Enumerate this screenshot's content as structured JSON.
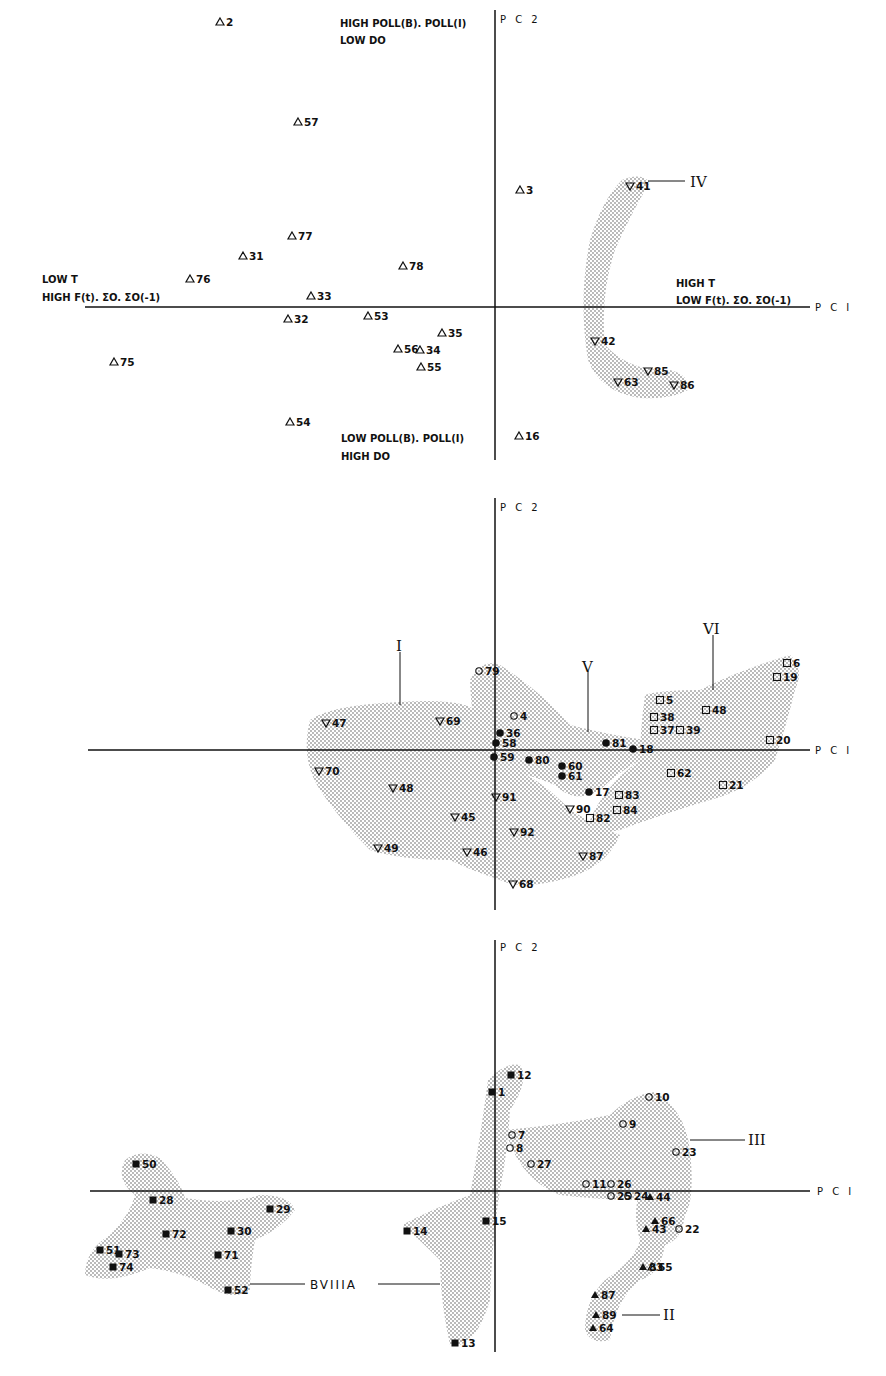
{
  "chart_data": [
    {
      "type": "scatter",
      "panel": "top",
      "xlabel": "PC I",
      "ylabel": "PC 2",
      "axis_annotations": {
        "top": [
          "HIGH POLL(B). POLL(I)",
          "LOW DO"
        ],
        "bottom": [
          "LOW POLL(B). POLL(I)",
          "HIGH DO"
        ],
        "left": [
          "LOW T",
          "HIGH F(t). ΣO. ΣO(-1)"
        ],
        "right": [
          "HIGH T",
          "LOW F(t). ΣO. ΣO(-1)"
        ]
      },
      "groups": [
        {
          "name": "IV",
          "marker": "down-triangle",
          "members": [
            "41",
            "42",
            "63",
            "85",
            "86"
          ]
        }
      ],
      "points": [
        {
          "id": "2",
          "marker": "triangle",
          "x": 220,
          "y": 22
        },
        {
          "id": "57",
          "marker": "triangle",
          "x": 298,
          "y": 122
        },
        {
          "id": "3",
          "marker": "triangle",
          "x": 520,
          "y": 190
        },
        {
          "id": "41",
          "marker": "down-triangle",
          "x": 630,
          "y": 186
        },
        {
          "id": "77",
          "marker": "triangle",
          "x": 292,
          "y": 236
        },
        {
          "id": "31",
          "marker": "triangle",
          "x": 243,
          "y": 256
        },
        {
          "id": "78",
          "marker": "triangle",
          "x": 403,
          "y": 266
        },
        {
          "id": "76",
          "marker": "triangle",
          "x": 190,
          "y": 279
        },
        {
          "id": "33",
          "marker": "triangle",
          "x": 311,
          "y": 296
        },
        {
          "id": "32",
          "marker": "triangle",
          "x": 288,
          "y": 319
        },
        {
          "id": "53",
          "marker": "triangle",
          "x": 368,
          "y": 316
        },
        {
          "id": "35",
          "marker": "triangle",
          "x": 442,
          "y": 333
        },
        {
          "id": "56",
          "marker": "triangle",
          "x": 398,
          "y": 349
        },
        {
          "id": "34",
          "marker": "triangle",
          "x": 420,
          "y": 350
        },
        {
          "id": "55",
          "marker": "triangle",
          "x": 421,
          "y": 367
        },
        {
          "id": "75",
          "marker": "triangle",
          "x": 114,
          "y": 362
        },
        {
          "id": "42",
          "marker": "down-triangle",
          "x": 595,
          "y": 341
        },
        {
          "id": "85",
          "marker": "down-triangle",
          "x": 648,
          "y": 371
        },
        {
          "id": "63",
          "marker": "down-triangle",
          "x": 618,
          "y": 382
        },
        {
          "id": "86",
          "marker": "down-triangle",
          "x": 674,
          "y": 385
        },
        {
          "id": "54",
          "marker": "triangle",
          "x": 290,
          "y": 422
        },
        {
          "id": "16",
          "marker": "triangle",
          "x": 519,
          "y": 436
        }
      ]
    },
    {
      "type": "scatter",
      "panel": "middle",
      "xlabel": "PC I",
      "ylabel": "PC 2",
      "groups": [
        {
          "name": "I",
          "marker": "down-triangle",
          "members": [
            "47",
            "69",
            "70",
            "48",
            "45",
            "49",
            "46",
            "91",
            "92",
            "90",
            "87",
            "68"
          ]
        },
        {
          "name": "V",
          "marker": "filled-circle",
          "members": [
            "79",
            "4",
            "36",
            "58",
            "59",
            "80",
            "60",
            "61",
            "81",
            "18",
            "17"
          ]
        },
        {
          "name": "VI",
          "marker": "square",
          "members": [
            "5",
            "38",
            "37",
            "39",
            "48",
            "6",
            "19",
            "20",
            "62",
            "21",
            "83",
            "84",
            "82"
          ]
        }
      ],
      "points": [
        {
          "id": "79",
          "marker": "circle",
          "x": 479,
          "y": 671
        },
        {
          "id": "4",
          "marker": "circle",
          "x": 514,
          "y": 716
        },
        {
          "id": "36",
          "marker": "filled-circle",
          "x": 500,
          "y": 733
        },
        {
          "id": "58",
          "marker": "filled-circle",
          "x": 496,
          "y": 743
        },
        {
          "id": "59",
          "marker": "filled-circle",
          "x": 494,
          "y": 757
        },
        {
          "id": "80",
          "marker": "filled-circle",
          "x": 529,
          "y": 760
        },
        {
          "id": "60",
          "marker": "filled-circle",
          "x": 562,
          "y": 766
        },
        {
          "id": "61",
          "marker": "filled-circle",
          "x": 562,
          "y": 776
        },
        {
          "id": "81",
          "marker": "filled-circle",
          "x": 606,
          "y": 743
        },
        {
          "id": "18",
          "marker": "filled-circle",
          "x": 633,
          "y": 749
        },
        {
          "id": "17",
          "marker": "filled-circle",
          "x": 589,
          "y": 792
        },
        {
          "id": "47",
          "marker": "down-triangle",
          "x": 326,
          "y": 723
        },
        {
          "id": "69",
          "marker": "down-triangle",
          "x": 440,
          "y": 721
        },
        {
          "id": "70",
          "marker": "down-triangle",
          "x": 319,
          "y": 771
        },
        {
          "id": "48",
          "marker": "down-triangle",
          "x": 393,
          "y": 788
        },
        {
          "id": "91",
          "marker": "down-triangle",
          "x": 496,
          "y": 797
        },
        {
          "id": "45",
          "marker": "down-triangle",
          "x": 455,
          "y": 817
        },
        {
          "id": "92",
          "marker": "down-triangle",
          "x": 514,
          "y": 832
        },
        {
          "id": "90",
          "marker": "down-triangle",
          "x": 570,
          "y": 809
        },
        {
          "id": "49",
          "marker": "down-triangle",
          "x": 378,
          "y": 848
        },
        {
          "id": "46",
          "marker": "down-triangle",
          "x": 467,
          "y": 852
        },
        {
          "id": "87",
          "marker": "down-triangle",
          "x": 583,
          "y": 856
        },
        {
          "id": "68",
          "marker": "down-triangle",
          "x": 513,
          "y": 884
        },
        {
          "id": "6",
          "marker": "square",
          "x": 787,
          "y": 663
        },
        {
          "id": "19",
          "marker": "square",
          "x": 777,
          "y": 677
        },
        {
          "id": "5",
          "marker": "square",
          "x": 660,
          "y": 700
        },
        {
          "id": "48",
          "marker": "square",
          "x": 706,
          "y": 710
        },
        {
          "id": "38",
          "marker": "square",
          "x": 654,
          "y": 717
        },
        {
          "id": "37",
          "marker": "square",
          "x": 654,
          "y": 730
        },
        {
          "id": "39",
          "marker": "square",
          "x": 680,
          "y": 730
        },
        {
          "id": "20",
          "marker": "square",
          "x": 770,
          "y": 740
        },
        {
          "id": "62",
          "marker": "square",
          "x": 671,
          "y": 773
        },
        {
          "id": "21",
          "marker": "square",
          "x": 723,
          "y": 785
        },
        {
          "id": "83",
          "marker": "square",
          "x": 619,
          "y": 795
        },
        {
          "id": "84",
          "marker": "square",
          "x": 617,
          "y": 810
        },
        {
          "id": "82",
          "marker": "square",
          "x": 590,
          "y": 818
        }
      ]
    },
    {
      "type": "scatter",
      "panel": "bottom",
      "xlabel": "PC I",
      "ylabel": "PC 2",
      "groups": [
        {
          "name": "BVIIIA",
          "marker": "filled-square",
          "members": [
            "50",
            "28",
            "29",
            "72",
            "30",
            "51",
            "73",
            "74",
            "71",
            "52",
            "14",
            "15",
            "13",
            "12",
            "1"
          ]
        },
        {
          "name": "III",
          "marker": "circle",
          "members": [
            "10",
            "9",
            "7",
            "8",
            "27",
            "23",
            "11",
            "26",
            "25",
            "24",
            "22"
          ]
        },
        {
          "name": "II",
          "marker": "filled-triangle",
          "members": [
            "44",
            "66",
            "43",
            "65",
            "83",
            "87",
            "89",
            "64"
          ]
        }
      ],
      "points": [
        {
          "id": "12",
          "marker": "filled-square",
          "x": 511,
          "y": 1075
        },
        {
          "id": "1",
          "marker": "filled-square",
          "x": 492,
          "y": 1092
        },
        {
          "id": "10",
          "marker": "circle",
          "x": 649,
          "y": 1097
        },
        {
          "id": "9",
          "marker": "circle",
          "x": 623,
          "y": 1124
        },
        {
          "id": "7",
          "marker": "circle",
          "x": 512,
          "y": 1135
        },
        {
          "id": "8",
          "marker": "circle",
          "x": 510,
          "y": 1148
        },
        {
          "id": "27",
          "marker": "circle",
          "x": 531,
          "y": 1164
        },
        {
          "id": "23",
          "marker": "circle",
          "x": 676,
          "y": 1152
        },
        {
          "id": "11",
          "marker": "circle",
          "x": 586,
          "y": 1184
        },
        {
          "id": "26",
          "marker": "circle",
          "x": 611,
          "y": 1184
        },
        {
          "id": "25",
          "marker": "circle",
          "x": 611,
          "y": 1196
        },
        {
          "id": "24",
          "marker": "circle",
          "x": 628,
          "y": 1196
        },
        {
          "id": "44",
          "marker": "filled-triangle",
          "x": 650,
          "y": 1197
        },
        {
          "id": "66",
          "marker": "filled-triangle",
          "x": 655,
          "y": 1221
        },
        {
          "id": "43",
          "marker": "filled-triangle",
          "x": 646,
          "y": 1229
        },
        {
          "id": "22",
          "marker": "circle",
          "x": 679,
          "y": 1229
        },
        {
          "id": "65",
          "marker": "open-triangle",
          "x": 652,
          "y": 1267
        },
        {
          "id": "83",
          "marker": "filled-triangle",
          "x": 643,
          "y": 1267
        },
        {
          "id": "87",
          "marker": "filled-triangle",
          "x": 595,
          "y": 1295
        },
        {
          "id": "89",
          "marker": "filled-triangle",
          "x": 596,
          "y": 1315
        },
        {
          "id": "64",
          "marker": "filled-triangle",
          "x": 593,
          "y": 1328
        },
        {
          "id": "50",
          "marker": "filled-square",
          "x": 136,
          "y": 1164
        },
        {
          "id": "28",
          "marker": "filled-square",
          "x": 153,
          "y": 1200
        },
        {
          "id": "29",
          "marker": "filled-square",
          "x": 270,
          "y": 1209
        },
        {
          "id": "72",
          "marker": "filled-square",
          "x": 166,
          "y": 1234
        },
        {
          "id": "30",
          "marker": "filled-square",
          "x": 231,
          "y": 1231
        },
        {
          "id": "51",
          "marker": "filled-square",
          "x": 100,
          "y": 1250
        },
        {
          "id": "73",
          "marker": "filled-square",
          "x": 119,
          "y": 1254
        },
        {
          "id": "74",
          "marker": "filled-square",
          "x": 113,
          "y": 1267
        },
        {
          "id": "71",
          "marker": "filled-square",
          "x": 218,
          "y": 1255
        },
        {
          "id": "52",
          "marker": "filled-square",
          "x": 228,
          "y": 1290
        },
        {
          "id": "14",
          "marker": "filled-square",
          "x": 407,
          "y": 1231
        },
        {
          "id": "15",
          "marker": "filled-square",
          "x": 486,
          "y": 1221
        },
        {
          "id": "13",
          "marker": "filled-square",
          "x": 455,
          "y": 1343
        }
      ]
    }
  ],
  "labels": {
    "pc1": "P C I",
    "pc2": "P C 2",
    "top_upper_1": "HIGH POLL(B). POLL(I)",
    "top_upper_2": "LOW DO",
    "top_lower_1": "LOW POLL(B). POLL(I)",
    "top_lower_2": "HIGH DO",
    "top_left_1": "LOW T",
    "top_left_2": "HIGH F(t). ΣO. ΣO(-1)",
    "top_right_1": "HIGH T",
    "top_right_2": "LOW F(t). ΣO. ΣO(-1)",
    "group_IV": "IV",
    "group_I": "I",
    "group_V": "V",
    "group_VI": "VI",
    "group_III": "III",
    "group_II": "II",
    "group_BVIIIA": "BVIIIA"
  }
}
